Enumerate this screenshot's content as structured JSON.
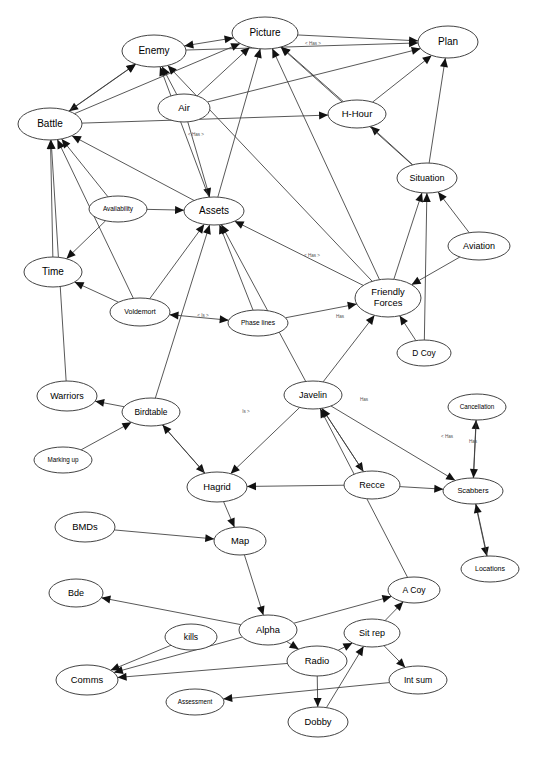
{
  "diagram": {
    "type": "directed-graph",
    "background_color": "#ffffff",
    "node_fill": "#ffffff",
    "node_stroke": "#444444",
    "edge_color": "#3a3a3a",
    "arrow_color": "#111111",
    "label_color": "#000000",
    "edge_label_color": "#555555"
  },
  "nodes": [
    {
      "id": "enemy",
      "label": "Enemy",
      "cx": 154,
      "cy": 51,
      "rx": 32,
      "ry": 16,
      "font": 10
    },
    {
      "id": "picture",
      "label": "Picture",
      "cx": 265,
      "cy": 33,
      "rx": 33,
      "ry": 16,
      "font": 10
    },
    {
      "id": "plan",
      "label": "Plan",
      "cx": 448,
      "cy": 42,
      "rx": 30,
      "ry": 16,
      "font": 10
    },
    {
      "id": "air",
      "label": "Air",
      "cx": 184,
      "cy": 108,
      "rx": 26,
      "ry": 14,
      "font": 9.5
    },
    {
      "id": "hhour",
      "label": "H-Hour",
      "cx": 357,
      "cy": 114,
      "rx": 29,
      "ry": 14,
      "font": 9.5
    },
    {
      "id": "battle",
      "label": "Battle",
      "cx": 50,
      "cy": 124,
      "rx": 32,
      "ry": 16,
      "font": 10
    },
    {
      "id": "situation",
      "label": "Situation",
      "cx": 427,
      "cy": 178,
      "rx": 30,
      "ry": 15,
      "font": 9
    },
    {
      "id": "availability",
      "label": "Availability",
      "cx": 118,
      "cy": 209,
      "rx": 29,
      "ry": 13,
      "font": 6.4
    },
    {
      "id": "assets",
      "label": "Assets",
      "cx": 214,
      "cy": 211,
      "rx": 30,
      "ry": 14,
      "font": 10
    },
    {
      "id": "aviation",
      "label": "Aviation",
      "cx": 479,
      "cy": 246,
      "rx": 31,
      "ry": 14,
      "font": 9
    },
    {
      "id": "time",
      "label": "Time",
      "cx": 53,
      "cy": 272,
      "rx": 29,
      "ry": 15,
      "font": 10
    },
    {
      "id": "voldemort",
      "label": "Voldemort",
      "cx": 140,
      "cy": 312,
      "rx": 30,
      "ry": 14,
      "font": 7
    },
    {
      "id": "phaselines",
      "label": "Phase lines",
      "cx": 258,
      "cy": 323,
      "rx": 30,
      "ry": 13,
      "font": 6.6
    },
    {
      "id": "friendly",
      "label": "Friendly Forces",
      "cx": 388,
      "cy": 298,
      "rx": 33,
      "ry": 19,
      "font": 9.4
    },
    {
      "id": "dcoy",
      "label": "D Coy",
      "cx": 424,
      "cy": 353,
      "rx": 27,
      "ry": 13,
      "font": 8.4
    },
    {
      "id": "warriors",
      "label": "Warriors",
      "cx": 67,
      "cy": 396,
      "rx": 30,
      "ry": 15,
      "font": 9
    },
    {
      "id": "birdtable",
      "label": "Birdtable",
      "cx": 151,
      "cy": 412,
      "rx": 29,
      "ry": 14,
      "font": 8.4
    },
    {
      "id": "javelin",
      "label": "Javelin",
      "cx": 313,
      "cy": 395,
      "rx": 29,
      "ry": 14,
      "font": 9
    },
    {
      "id": "cancellation",
      "label": "Cancellation",
      "cx": 477,
      "cy": 407,
      "rx": 29,
      "ry": 13,
      "font": 6.3
    },
    {
      "id": "markingup",
      "label": "Marking up",
      "cx": 63,
      "cy": 460,
      "rx": 29,
      "ry": 13,
      "font": 6.3
    },
    {
      "id": "hagrid",
      "label": "Hagrid",
      "cx": 217,
      "cy": 487,
      "rx": 30,
      "ry": 15,
      "font": 9.4
    },
    {
      "id": "recce",
      "label": "Recce",
      "cx": 372,
      "cy": 485,
      "rx": 28,
      "ry": 14,
      "font": 9
    },
    {
      "id": "scabbers",
      "label": "Scabbers",
      "cx": 473,
      "cy": 491,
      "rx": 30,
      "ry": 13,
      "font": 7.4
    },
    {
      "id": "bmds",
      "label": "BMDs",
      "cx": 85,
      "cy": 527,
      "rx": 30,
      "ry": 15,
      "font": 9.4
    },
    {
      "id": "map",
      "label": "Map",
      "cx": 240,
      "cy": 541,
      "rx": 26,
      "ry": 14,
      "font": 9.4
    },
    {
      "id": "locations",
      "label": "Locations",
      "cx": 490,
      "cy": 569,
      "rx": 29,
      "ry": 13,
      "font": 7
    },
    {
      "id": "bde",
      "label": "Bde",
      "cx": 76,
      "cy": 593,
      "rx": 27,
      "ry": 14,
      "font": 9
    },
    {
      "id": "acoy",
      "label": "A Coy",
      "cx": 414,
      "cy": 590,
      "rx": 26,
      "ry": 13,
      "font": 8.6
    },
    {
      "id": "kills",
      "label": "kills",
      "cx": 191,
      "cy": 637,
      "rx": 26,
      "ry": 13,
      "font": 8.6
    },
    {
      "id": "alpha",
      "label": "Alpha",
      "cx": 268,
      "cy": 630,
      "rx": 29,
      "ry": 15,
      "font": 9.4
    },
    {
      "id": "sitrep",
      "label": "Sit rep",
      "cx": 372,
      "cy": 633,
      "rx": 28,
      "ry": 14,
      "font": 9
    },
    {
      "id": "radio",
      "label": "Radio",
      "cx": 317,
      "cy": 661,
      "rx": 30,
      "ry": 15,
      "font": 9.4
    },
    {
      "id": "comms",
      "label": "Comms",
      "cx": 87,
      "cy": 680,
      "rx": 31,
      "ry": 15,
      "font": 9.4
    },
    {
      "id": "intsum",
      "label": "Int sum",
      "cx": 418,
      "cy": 680,
      "rx": 29,
      "ry": 14,
      "font": 8.6
    },
    {
      "id": "assessment",
      "label": "Assessment",
      "cx": 195,
      "cy": 702,
      "rx": 29,
      "ry": 13,
      "font": 6.3
    },
    {
      "id": "dobby",
      "label": "Dobby",
      "cx": 318,
      "cy": 722,
      "rx": 30,
      "ry": 15,
      "font": 9.4
    }
  ],
  "edge_labels": [
    {
      "text": "< Has >",
      "x": 313,
      "y": 44
    },
    {
      "text": "< Has >",
      "x": 196,
      "y": 135
    },
    {
      "text": "< Has >",
      "x": 312,
      "y": 256
    },
    {
      "text": "Has",
      "x": 340,
      "y": 317
    },
    {
      "text": "< Is >",
      "x": 203,
      "y": 316
    },
    {
      "text": "Is >",
      "x": 246,
      "y": 412
    },
    {
      "text": "Has",
      "x": 364,
      "y": 400
    },
    {
      "text": "< Has",
      "x": 447,
      "y": 437
    },
    {
      "text": "Has",
      "x": 473,
      "y": 442
    }
  ],
  "edges": [
    {
      "from": "enemy",
      "to": "picture",
      "dir": "both"
    },
    {
      "from": "picture",
      "to": "plan",
      "dir": "to"
    },
    {
      "from": "enemy",
      "to": "plan",
      "dir": "to"
    },
    {
      "from": "enemy",
      "to": "battle",
      "dir": "both"
    },
    {
      "from": "battle",
      "to": "enemy",
      "dir": "to"
    },
    {
      "from": "air",
      "to": "enemy",
      "dir": "to"
    },
    {
      "from": "air",
      "to": "picture",
      "dir": "to"
    },
    {
      "from": "air",
      "to": "plan",
      "dir": "to"
    },
    {
      "from": "air",
      "to": "assets",
      "dir": "to"
    },
    {
      "from": "hhour",
      "to": "plan",
      "dir": "to"
    },
    {
      "from": "hhour",
      "to": "picture",
      "dir": "to"
    },
    {
      "from": "battle",
      "to": "picture",
      "dir": "to"
    },
    {
      "from": "battle",
      "to": "hhour",
      "dir": "to"
    },
    {
      "from": "situation",
      "to": "plan",
      "dir": "to"
    },
    {
      "from": "situation",
      "to": "hhour",
      "dir": "to"
    },
    {
      "from": "situation",
      "to": "picture",
      "dir": "to"
    },
    {
      "from": "assets",
      "to": "enemy",
      "dir": "to"
    },
    {
      "from": "assets",
      "to": "battle",
      "dir": "to"
    },
    {
      "from": "assets",
      "to": "picture",
      "dir": "to"
    },
    {
      "from": "availability",
      "to": "battle",
      "dir": "to"
    },
    {
      "from": "availability",
      "to": "time",
      "dir": "to"
    },
    {
      "from": "availability",
      "to": "assets",
      "dir": "to"
    },
    {
      "from": "time",
      "to": "battle",
      "dir": "to"
    },
    {
      "from": "voldemort",
      "to": "time",
      "dir": "to"
    },
    {
      "from": "voldemort",
      "to": "phaselines",
      "dir": "both"
    },
    {
      "from": "voldemort",
      "to": "battle",
      "dir": "to"
    },
    {
      "from": "voldemort",
      "to": "assets",
      "dir": "to"
    },
    {
      "from": "phaselines",
      "to": "assets",
      "dir": "to"
    },
    {
      "from": "phaselines",
      "to": "friendly",
      "dir": "to"
    },
    {
      "from": "friendly",
      "to": "situation",
      "dir": "to"
    },
    {
      "from": "friendly",
      "to": "picture",
      "dir": "to"
    },
    {
      "from": "friendly",
      "to": "enemy",
      "dir": "to"
    },
    {
      "from": "friendly",
      "to": "assets",
      "dir": "to"
    },
    {
      "from": "aviation",
      "to": "situation",
      "dir": "to"
    },
    {
      "from": "aviation",
      "to": "friendly",
      "dir": "to"
    },
    {
      "from": "dcoy",
      "to": "friendly",
      "dir": "to"
    },
    {
      "from": "dcoy",
      "to": "situation",
      "dir": "to"
    },
    {
      "from": "javelin",
      "to": "friendly",
      "dir": "to"
    },
    {
      "from": "javelin",
      "to": "assets",
      "dir": "to"
    },
    {
      "from": "javelin",
      "to": "hagrid",
      "dir": "to"
    },
    {
      "from": "javelin",
      "to": "recce",
      "dir": "to"
    },
    {
      "from": "javelin",
      "to": "scabbers",
      "dir": "to"
    },
    {
      "from": "birdtable",
      "to": "warriors",
      "dir": "to"
    },
    {
      "from": "birdtable",
      "to": "assets",
      "dir": "to"
    },
    {
      "from": "birdtable",
      "to": "hagrid",
      "dir": "to"
    },
    {
      "from": "warriors",
      "to": "battle",
      "dir": "to"
    },
    {
      "from": "markingup",
      "to": "birdtable",
      "dir": "to"
    },
    {
      "from": "hagrid",
      "to": "map",
      "dir": "to"
    },
    {
      "from": "hagrid",
      "to": "birdtable",
      "dir": "to"
    },
    {
      "from": "recce",
      "to": "hagrid",
      "dir": "to"
    },
    {
      "from": "recce",
      "to": "scabbers",
      "dir": "to"
    },
    {
      "from": "recce",
      "to": "javelin",
      "dir": "to"
    },
    {
      "from": "scabbers",
      "to": "cancellation",
      "dir": "to"
    },
    {
      "from": "scabbers",
      "to": "locations",
      "dir": "to"
    },
    {
      "from": "cancellation",
      "to": "scabbers",
      "dir": "to"
    },
    {
      "from": "bmds",
      "to": "map",
      "dir": "to"
    },
    {
      "from": "map",
      "to": "alpha",
      "dir": "to"
    },
    {
      "from": "alpha",
      "to": "bde",
      "dir": "to"
    },
    {
      "from": "alpha",
      "to": "comms",
      "dir": "to"
    },
    {
      "from": "alpha",
      "to": "radio",
      "dir": "to"
    },
    {
      "from": "alpha",
      "to": "acoy",
      "dir": "to"
    },
    {
      "from": "radio",
      "to": "dobby",
      "dir": "to"
    },
    {
      "from": "radio",
      "to": "sitrep",
      "dir": "to"
    },
    {
      "from": "radio",
      "to": "comms",
      "dir": "to"
    },
    {
      "from": "sitrep",
      "to": "intsum",
      "dir": "to"
    },
    {
      "from": "sitrep",
      "to": "acoy",
      "dir": "to"
    },
    {
      "from": "dobby",
      "to": "sitrep",
      "dir": "to"
    },
    {
      "from": "intsum",
      "to": "assessment",
      "dir": "to"
    },
    {
      "from": "kills",
      "to": "comms",
      "dir": "to"
    },
    {
      "from": "acoy",
      "to": "javelin",
      "dir": "to"
    },
    {
      "from": "locations",
      "to": "scabbers",
      "dir": "to"
    }
  ]
}
